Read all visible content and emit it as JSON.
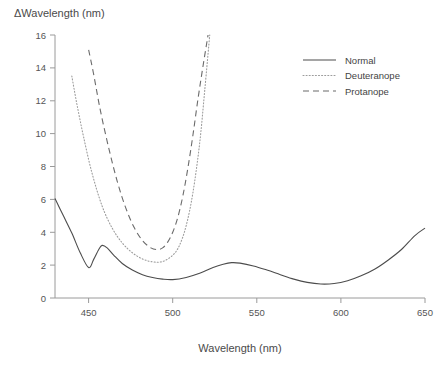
{
  "chart_data": {
    "type": "line",
    "title": "",
    "xlabel": "Wavelength (nm)",
    "ylabel": "ΔWavelength (nm)",
    "xlim": [
      430,
      650
    ],
    "ylim": [
      0,
      16
    ],
    "xticks": [
      450,
      500,
      550,
      600,
      650
    ],
    "yticks": [
      0,
      2,
      4,
      6,
      8,
      10,
      12,
      14,
      16
    ],
    "grid": false,
    "legend_position": "top-right",
    "series": [
      {
        "name": "Normal",
        "style": "solid",
        "color": "#4c4c4c",
        "x": [
          430,
          435,
          440,
          445,
          450,
          453,
          456,
          458,
          461,
          465,
          470,
          476,
          482,
          488,
          494,
          500,
          508,
          516,
          524,
          530,
          535,
          540,
          548,
          556,
          564,
          572,
          580,
          588,
          596,
          604,
          612,
          620,
          628,
          636,
          644,
          650
        ],
        "y": [
          6.05,
          5.0,
          3.95,
          2.75,
          1.85,
          2.35,
          2.95,
          3.2,
          3.05,
          2.6,
          2.1,
          1.7,
          1.42,
          1.25,
          1.15,
          1.12,
          1.25,
          1.5,
          1.85,
          2.05,
          2.15,
          2.12,
          1.95,
          1.7,
          1.42,
          1.15,
          0.95,
          0.85,
          0.88,
          1.05,
          1.35,
          1.75,
          2.3,
          2.95,
          3.8,
          4.25
        ]
      },
      {
        "name": "Deuteranope",
        "style": "dotted",
        "color": "#9c9c9c",
        "x": [
          440,
          443,
          447,
          452,
          458,
          464,
          470,
          476,
          482,
          488,
          494,
          500,
          504,
          508,
          512,
          516,
          519,
          522
        ],
        "y": [
          13.5,
          11.8,
          9.8,
          7.6,
          5.6,
          4.25,
          3.35,
          2.75,
          2.38,
          2.2,
          2.22,
          2.6,
          3.2,
          4.4,
          6.4,
          9.4,
          12.6,
          16.0
        ]
      },
      {
        "name": "Protanope",
        "style": "dashed",
        "color": "#6b6b6b",
        "x": [
          450,
          453,
          457,
          462,
          467,
          472,
          477,
          482,
          487,
          491,
          494,
          497,
          500,
          503,
          506,
          509,
          512,
          515,
          518,
          521
        ],
        "y": [
          15.1,
          13.6,
          11.4,
          9.1,
          7.1,
          5.5,
          4.3,
          3.5,
          3.05,
          2.95,
          3.05,
          3.4,
          4.0,
          4.9,
          6.2,
          7.9,
          9.9,
          12.1,
          14.1,
          16.0
        ]
      }
    ]
  },
  "legend": {
    "items": [
      {
        "label": "Normal"
      },
      {
        "label": "Deuteranope"
      },
      {
        "label": "Protanope"
      }
    ]
  }
}
